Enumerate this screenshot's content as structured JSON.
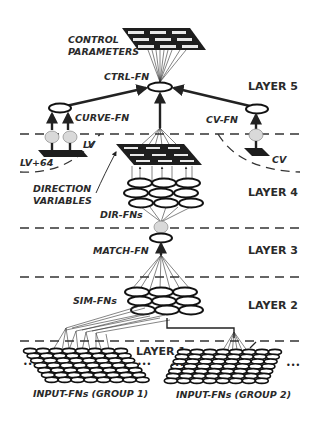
{
  "diagram": {
    "layers": [
      {
        "id": "layer5",
        "label": "LAYER 5"
      },
      {
        "id": "layer4",
        "label": "LAYER 4"
      },
      {
        "id": "layer3",
        "label": "LAYER 3"
      },
      {
        "id": "layer2",
        "label": "LAYER 2"
      },
      {
        "id": "layer1",
        "label": "LAYER 1"
      }
    ],
    "labels": {
      "control_parameters_line1": "CONTROL",
      "control_parameters_line2": "PARAMETERS",
      "ctrl_fn": "CTRL-FN",
      "curve_fn": "CURVE-FN",
      "cv_fn": "CV-FN",
      "lv": "LV",
      "lv64": "LV+64",
      "cv": "CV",
      "direction_variables_line1": "DIRECTION",
      "direction_variables_line2": "VARIABLES",
      "dir_fns": "DIR-FNs",
      "match_fn": "MATCH-FN",
      "sim_fns": "SIM-FNs",
      "input_group1": "INPUT-FNs (GROUP 1)",
      "input_group2": "INPUT-FNs (GROUP 2)"
    },
    "edges": [
      {
        "from": "control-parameters",
        "to": "ctrl-fn"
      },
      {
        "from": "curve-fn",
        "to": "ctrl-fn"
      },
      {
        "from": "cv-fn",
        "to": "ctrl-fn"
      },
      {
        "from": "direction-variables",
        "to": "ctrl-fn"
      },
      {
        "from": "lv",
        "to": "curve-fn"
      },
      {
        "from": "lv+64",
        "to": "curve-fn"
      },
      {
        "from": "cv",
        "to": "cv-fn"
      },
      {
        "from": "dir-fns",
        "to": "direction-variables"
      },
      {
        "from": "match-fn",
        "to": "dir-fns"
      },
      {
        "from": "sim-fns",
        "to": "match-fn"
      },
      {
        "from": "input-fns-group-1",
        "to": "sim-fns"
      },
      {
        "from": "input-fns-group-2",
        "to": "sim-fns"
      }
    ],
    "colors": {
      "ink": "#222222",
      "background": "#ffffff",
      "cell": "#e8e8e8"
    }
  }
}
